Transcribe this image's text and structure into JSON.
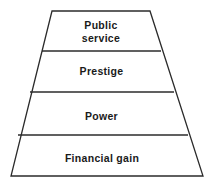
{
  "figure": {
    "kind": "trapezoid-tier-diagram",
    "background_color": "#ffffff",
    "line_color": "#2b2b2b",
    "text_color": "#1a1a1a",
    "tier_count": 4
  },
  "tiers": [
    {
      "id": "tier-public-service",
      "label": "Public\nservice",
      "order": 1,
      "position": "top"
    },
    {
      "id": "tier-prestige",
      "label": "Prestige",
      "order": 2,
      "position": "upper-middle"
    },
    {
      "id": "tier-power",
      "label": "Power",
      "order": 3,
      "position": "lower-middle"
    },
    {
      "id": "tier-financial-gain",
      "label": "Financial gain",
      "order": 4,
      "position": "bottom"
    }
  ],
  "geometry": {
    "top_left": {
      "x": 52,
      "y": 11
    },
    "top_right": {
      "x": 150,
      "y": 11
    },
    "bottom_right": {
      "x": 203,
      "y": 176
    },
    "bottom_left": {
      "x": 11,
      "y": 176
    },
    "dividers": [
      {
        "y": 51,
        "x_left": 42,
        "x_right": 161
      },
      {
        "y": 92,
        "x_left": 30,
        "x_right": 174
      },
      {
        "y": 135,
        "x_left": 18,
        "x_right": 188
      }
    ]
  }
}
